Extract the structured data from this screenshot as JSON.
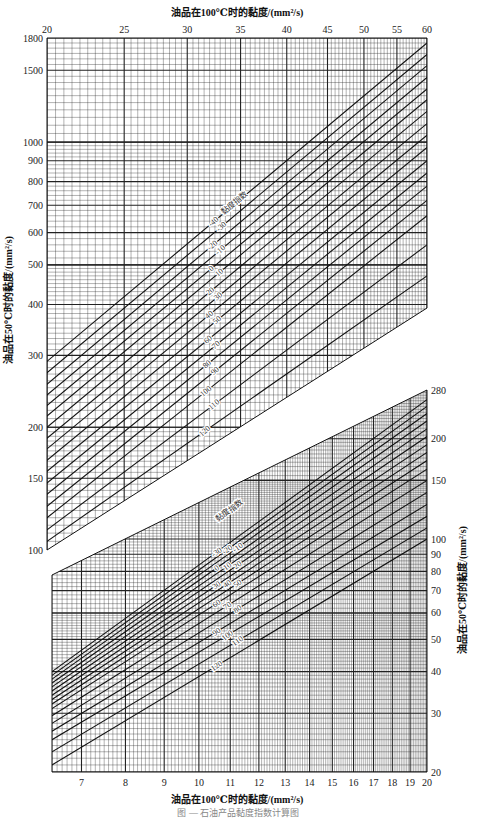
{
  "chart_data": [
    {
      "type": "line",
      "name": "upper-nomogram",
      "title": "",
      "xlabel": "油品在100℃时的黏度/(mm²/s)",
      "ylabel": "油品在50℃时的黏度/(mm²/s)",
      "x_axis_position": "top",
      "y_axis_position": "left",
      "x_scale": "log",
      "y_scale": "log",
      "xlim": [
        20,
        60
      ],
      "ylim": [
        100,
        1800
      ],
      "x_ticks": [
        20,
        25,
        30,
        35,
        40,
        45,
        50,
        55,
        60
      ],
      "y_ticks": [
        100,
        150,
        200,
        300,
        400,
        500,
        600,
        700,
        800,
        900,
        1000,
        1500,
        1800
      ],
      "grid": true,
      "legend_title": "黏度指数",
      "series_labels": [
        "-40",
        "-30",
        "-20",
        "-10",
        "0",
        "10",
        "20",
        "30",
        "40",
        "50",
        "60",
        "70",
        "80",
        "90",
        "100",
        "110",
        "120"
      ],
      "series": [
        {
          "name": "-40",
          "x": [
            20,
            60
          ],
          "y": [
            290,
            1750
          ]
        },
        {
          "name": "-30",
          "x": [
            20,
            60
          ],
          "y": [
            272,
            1640
          ]
        },
        {
          "name": "-20",
          "x": [
            20,
            60
          ],
          "y": [
            255,
            1540
          ]
        },
        {
          "name": "-10",
          "x": [
            20,
            60
          ],
          "y": [
            240,
            1440
          ]
        },
        {
          "name": "0",
          "x": [
            20,
            60
          ],
          "y": [
            226,
            1350
          ]
        },
        {
          "name": "10",
          "x": [
            20,
            60
          ],
          "y": [
            213,
            1270
          ]
        },
        {
          "name": "20",
          "x": [
            20,
            60
          ],
          "y": [
            200,
            1190
          ]
        },
        {
          "name": "30",
          "x": [
            20,
            60
          ],
          "y": [
            188,
            1110
          ]
        },
        {
          "name": "40",
          "x": [
            20,
            60
          ],
          "y": [
            177,
            1040
          ]
        },
        {
          "name": "50",
          "x": [
            20,
            60
          ],
          "y": [
            166,
            970
          ]
        },
        {
          "name": "60",
          "x": [
            20,
            60
          ],
          "y": [
            156,
            900
          ]
        },
        {
          "name": "70",
          "x": [
            20,
            60
          ],
          "y": [
            146,
            840
          ]
        },
        {
          "name": "80",
          "x": [
            20,
            60
          ],
          "y": [
            137,
            780
          ]
        },
        {
          "name": "90",
          "x": [
            20,
            60
          ],
          "y": [
            128,
            720
          ]
        },
        {
          "name": "100",
          "x": [
            20,
            60
          ],
          "y": [
            120,
            660
          ]
        },
        {
          "name": "110",
          "x": [
            20,
            60
          ],
          "y": [
            112,
            560
          ]
        },
        {
          "name": "120",
          "x": [
            20,
            60
          ],
          "y": [
            105,
            470
          ]
        }
      ]
    },
    {
      "type": "line",
      "name": "lower-nomogram",
      "title": "",
      "xlabel": "油品在100℃时的黏度/(mm²/s)",
      "ylabel": "油品在50℃时的黏度/(mm²/s)",
      "x_axis_position": "bottom",
      "y_axis_position": "right",
      "x_scale": "log",
      "y_scale": "log",
      "xlim": [
        6.4,
        20
      ],
      "ylim": [
        20,
        280
      ],
      "x_ticks": [
        7,
        8,
        9,
        10,
        11,
        12,
        13,
        14,
        15,
        16,
        17,
        18,
        19,
        20
      ],
      "y_ticks": [
        20,
        30,
        40,
        50,
        60,
        70,
        80,
        90,
        100,
        150,
        200,
        280
      ],
      "grid": true,
      "legend_title": "黏度指数",
      "series_labels": [
        "-30",
        "-20",
        "-10",
        "0",
        "10",
        "20",
        "30",
        "40",
        "50",
        "60",
        "70",
        "80",
        "90",
        "100",
        "110",
        "120"
      ],
      "series": [
        {
          "name": "-30",
          "x": [
            6.4,
            20
          ],
          "y": [
            40,
            262
          ]
        },
        {
          "name": "-20",
          "x": [
            6.4,
            20
          ],
          "y": [
            39,
            250
          ]
        },
        {
          "name": "-10",
          "x": [
            6.4,
            20
          ],
          "y": [
            38,
            238
          ]
        },
        {
          "name": "0",
          "x": [
            6.4,
            20
          ],
          "y": [
            37,
            226
          ]
        },
        {
          "name": "10",
          "x": [
            6.4,
            20
          ],
          "y": [
            36,
            214
          ]
        },
        {
          "name": "20",
          "x": [
            6.4,
            20
          ],
          "y": [
            35,
            203
          ]
        },
        {
          "name": "30",
          "x": [
            6.4,
            20
          ],
          "y": [
            34,
            192
          ]
        },
        {
          "name": "40",
          "x": [
            6.4,
            20
          ],
          "y": [
            33,
            182
          ]
        },
        {
          "name": "50",
          "x": [
            6.4,
            20
          ],
          "y": [
            32,
            172
          ]
        },
        {
          "name": "60",
          "x": [
            6.4,
            20
          ],
          "y": [
            31,
            162
          ]
        },
        {
          "name": "70",
          "x": [
            6.4,
            20
          ],
          "y": [
            29.5,
            150
          ]
        },
        {
          "name": "80",
          "x": [
            6.4,
            20
          ],
          "y": [
            28,
            138
          ]
        },
        {
          "name": "90",
          "x": [
            6.4,
            20
          ],
          "y": [
            26.5,
            127
          ]
        },
        {
          "name": "100",
          "x": [
            6.4,
            20
          ],
          "y": [
            25,
            117
          ]
        },
        {
          "name": "110",
          "x": [
            6.4,
            20
          ],
          "y": [
            23,
            108
          ]
        },
        {
          "name": "120",
          "x": [
            6.4,
            20
          ],
          "y": [
            21,
            100
          ]
        }
      ]
    }
  ],
  "labels": {
    "top_axis_title": "油品在100℃时的黏度/(mm²/s)",
    "bottom_axis_title": "油品在100℃时的黏度/(mm²/s)",
    "left_axis_title": "油品在50℃时的黏度/(mm²/s)",
    "right_axis_title": "油品在50℃时的黏度/(mm²/s)",
    "upper_legend_title": "黏度指数",
    "lower_legend_title": "黏度指数",
    "caption": "图 — 石油产品黏度指数计算图"
  }
}
